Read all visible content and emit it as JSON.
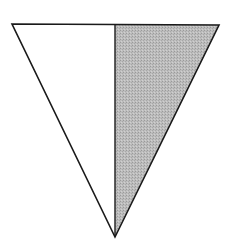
{
  "diagram": {
    "shape": "inverted-triangle",
    "vertices": {
      "top_left": [
        12,
        24
      ],
      "top_right": [
        219,
        25
      ],
      "bottom": [
        115,
        237
      ]
    },
    "divider_x": 115,
    "regions": [
      {
        "name": "left-half",
        "fill": "#ffffff"
      },
      {
        "name": "right-half",
        "fill": "#b8b8b8",
        "pattern": "stipple"
      }
    ],
    "stroke_color": "#1a1a1a"
  }
}
